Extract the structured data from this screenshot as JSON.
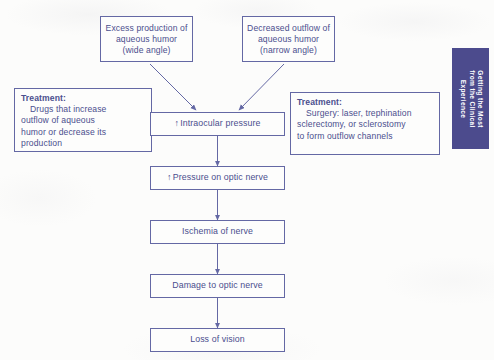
{
  "figure": {
    "type": "flowchart",
    "line_color": "#6468a4",
    "text_color": "#4b4f8e",
    "tab_color": "#4c4b8d",
    "background_color": "#fcfcfb"
  },
  "causes": [
    {
      "id": "excess-production",
      "lines": [
        "Excess production",
        "of aqueous humor",
        "(wide angle)"
      ]
    },
    {
      "id": "decreased-outflow",
      "lines": [
        "Decreased outflow",
        "of aqueous humor",
        "(narrow angle)"
      ]
    }
  ],
  "chain": [
    {
      "id": "intraocular-pressure",
      "arrow": "↑",
      "label": "Intraocular pressure"
    },
    {
      "id": "pressure-on-optic-nerve",
      "arrow": "↑",
      "label": "Pressure on optic nerve"
    },
    {
      "id": "ischemia-of-nerve",
      "arrow": "",
      "label": "Ischemia of nerve"
    },
    {
      "id": "damage-to-optic-nerve",
      "arrow": "",
      "label": "Damage to optic nerve"
    },
    {
      "id": "loss-of-vision",
      "arrow": "",
      "label": "Loss of vision"
    }
  ],
  "treatments": [
    {
      "id": "medical-treatment",
      "heading": "Treatment:",
      "body_first": "Drugs that increase",
      "body_rest": [
        "outflow of aqueous",
        "humor or decrease its",
        "production"
      ]
    },
    {
      "id": "surgical-treatment",
      "heading": "Treatment:",
      "body_first": "Surgery: laser, trephination",
      "body_rest": [
        "sclerectomy, or sclerostomy",
        "to form outflow channels"
      ]
    }
  ],
  "side_tab": {
    "lines": [
      "Getting the Most",
      "from the Clinical",
      "Experience"
    ]
  }
}
